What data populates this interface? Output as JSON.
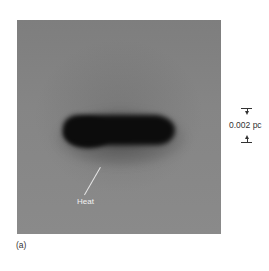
{
  "figure": {
    "panel_label": "(a)",
    "annotation": {
      "label": "Heat"
    },
    "scale_bar": {
      "label": "0.002 pc"
    },
    "colors": {
      "background": "#858585",
      "object": "#0c0c0c",
      "annotation_text": "#f2f2f2",
      "caption_text": "#333333"
    }
  }
}
